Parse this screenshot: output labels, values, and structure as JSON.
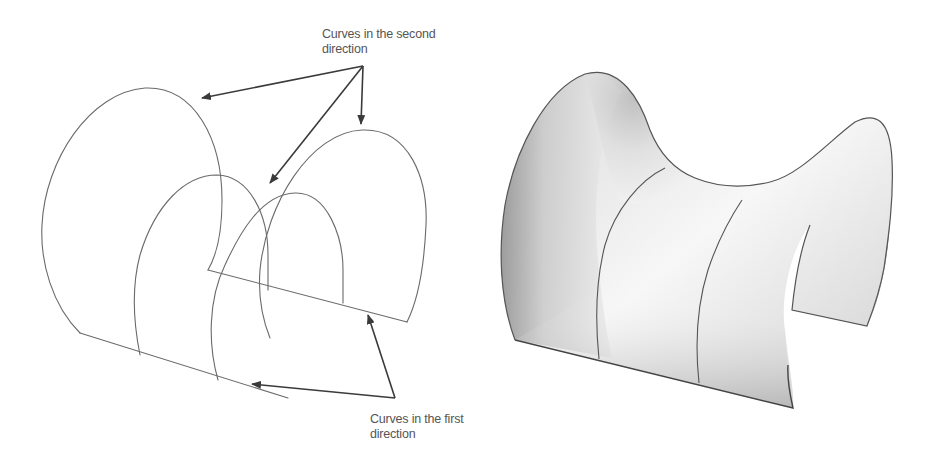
{
  "figure": {
    "panels": [
      {
        "id": "wireframe",
        "description": "Wireframe of curves in two directions"
      },
      {
        "id": "surface",
        "description": "Shaded saddle-shaped surface with two curves in the second direction"
      }
    ],
    "annotations": {
      "second_direction": {
        "label": "Curves in the second\ndirection",
        "arrow_count": 3
      },
      "first_direction": {
        "label": "Curves in the first\ndirection",
        "arrow_count": 2
      }
    },
    "colors": {
      "line": "#6a6a6a",
      "arrow": "#3a3a3a",
      "label": "#555555",
      "surface_light": "#f4f4f4",
      "surface_dark": "#9a9a9a"
    }
  }
}
